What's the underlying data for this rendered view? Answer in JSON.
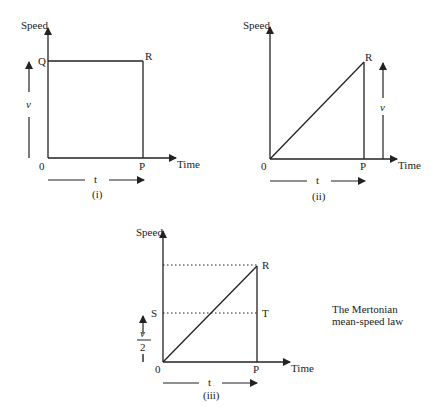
{
  "diagrams": [
    {
      "caption": "(i)",
      "y_axis_label": "Speed",
      "x_axis_label": "Time",
      "origin_label": "0",
      "points": {
        "Q": "Q",
        "R": "R",
        "P": "P"
      },
      "speed_arrow_label": "v",
      "time_arrow_label": "t"
    },
    {
      "caption": "(ii)",
      "y_axis_label": "Speed",
      "x_axis_label": "Time",
      "origin_label": "0",
      "points": {
        "R": "R",
        "P": "P"
      },
      "speed_arrow_label": "v",
      "time_arrow_label": "t"
    },
    {
      "caption": "(iii)",
      "y_axis_label": "Speed",
      "x_axis_label": "Time",
      "origin_label": "0",
      "points": {
        "R": "R",
        "S": "S",
        "T": "T",
        "P": "P"
      },
      "speed_arrow_label_num": "v",
      "speed_arrow_label_den": "2",
      "time_arrow_label": "t"
    }
  ],
  "annotation": {
    "line1": "The Mertonian",
    "line2": "mean-speed law"
  }
}
